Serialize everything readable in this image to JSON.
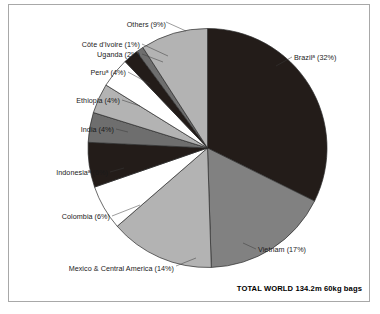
{
  "figure": {
    "frame_color": "#a8a8a8",
    "background": "#ffffff",
    "footer_note": "TOTAL WORLD 134.2m 60kg bags"
  },
  "chart_data": {
    "type": "pie",
    "title": "",
    "subtitle": "",
    "xlabel": "",
    "ylabel": "",
    "unit": "60kg bags",
    "total_label": "TOTAL WORLD 134.2m 60kg bags",
    "total_value": 134.2,
    "total_unit": "m 60kg bags",
    "legend_position": "callout-labels",
    "grid": false,
    "start_angle_deg": 0,
    "direction": "clockwise",
    "categories": [
      "Brazil",
      "Vietnam",
      "Mexico & Central America",
      "Colombia",
      "Indonesia",
      "India",
      "Ethiopia",
      "Peru",
      "Uganda",
      "Côte d'Ivoire",
      "Others"
    ],
    "values": [
      32,
      17,
      14,
      6,
      6,
      4,
      4,
      4,
      2,
      1,
      9
    ],
    "slices": [
      {
        "name": "Brazil",
        "label": "Brazil",
        "superscript": "a",
        "value": 32,
        "value_text": "(32%)",
        "full_label": "Brazilᵃ (32%)",
        "color": "#231c19"
      },
      {
        "name": "Vietnam",
        "label": "Vietnam",
        "superscript": "",
        "value": 17,
        "value_text": "(17%)",
        "full_label": "Vietnam (17%)",
        "color": "#818181"
      },
      {
        "name": "Mexico & Central America",
        "label": "Mexico & Central America",
        "superscript": "",
        "value": 14,
        "value_text": "(14%)",
        "full_label": "Mexico & Central America (14%)",
        "color": "#b3b3b3"
      },
      {
        "name": "Colombia",
        "label": "Colombia",
        "superscript": "",
        "value": 6,
        "value_text": "(6%)",
        "full_label": "Colombia (6%)",
        "color": "#ffffff"
      },
      {
        "name": "Indonesia",
        "label": "Indonesia",
        "superscript": "a",
        "value": 6,
        "value_text": "(6%)",
        "full_label": "Indonesiaᵃ (6%)",
        "color": "#231c19"
      },
      {
        "name": "India",
        "label": "India",
        "superscript": "",
        "value": 4,
        "value_text": "(4%)",
        "full_label": "India (4%)",
        "color": "#6e6e6e"
      },
      {
        "name": "Ethiopia",
        "label": "Ethiopia",
        "superscript": "",
        "value": 4,
        "value_text": "(4%)",
        "full_label": "Ethiopia (4%)",
        "color": "#b3b3b3"
      },
      {
        "name": "Peru",
        "label": "Peru",
        "superscript": "a",
        "value": 4,
        "value_text": "(4%)",
        "full_label": "Peruᵃ (4%)",
        "color": "#ffffff"
      },
      {
        "name": "Uganda",
        "label": "Uganda",
        "superscript": "",
        "value": 2,
        "value_text": "(2%)",
        "full_label": "Uganda (2%)",
        "color": "#231c19"
      },
      {
        "name": "Côte d'Ivoire",
        "label": "Côte d'Ivoire",
        "superscript": "",
        "value": 1,
        "value_text": "(1%)",
        "full_label": "Côte d'Ivoire (1%)",
        "color": "#6e6e6e"
      },
      {
        "name": "Others",
        "label": "Others",
        "superscript": "",
        "value": 9,
        "value_text": "(9%)",
        "full_label": "Others (9%)",
        "color": "#b3b3b3"
      }
    ]
  }
}
